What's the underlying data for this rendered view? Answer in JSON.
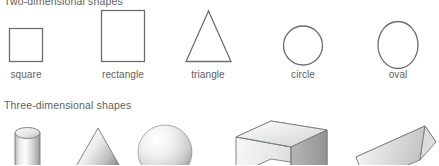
{
  "figure": {
    "section_2d": {
      "heading": "Two-dimensional shapes",
      "shapes": [
        {
          "name": "square",
          "label": "square",
          "icon": "square-outline-icon"
        },
        {
          "name": "rectangle",
          "label": "rectangle",
          "icon": "rectangle-outline-icon"
        },
        {
          "name": "triangle",
          "label": "triangle",
          "icon": "triangle-outline-icon"
        },
        {
          "name": "circle",
          "label": "circle",
          "icon": "circle-outline-icon"
        },
        {
          "name": "oval",
          "label": "oval",
          "icon": "oval-outline-icon"
        }
      ]
    },
    "section_3d": {
      "heading": "Three-dimensional shapes",
      "shapes": [
        {
          "name": "cylinder",
          "icon": "cylinder-solid-icon"
        },
        {
          "name": "cone",
          "icon": "cone-solid-icon"
        },
        {
          "name": "sphere",
          "icon": "sphere-solid-icon"
        },
        {
          "name": "rectangular-prism",
          "icon": "rectangular-prism-solid-icon"
        },
        {
          "name": "triangular-prism",
          "icon": "triangular-prism-solid-icon"
        }
      ]
    },
    "colors": {
      "outline": "#6d6e71",
      "text": "#5e5f61",
      "background": "#ffffff",
      "solid_light": "#f2f2f2",
      "solid_mid": "#c9cacb",
      "solid_dark": "#8e9092"
    }
  }
}
